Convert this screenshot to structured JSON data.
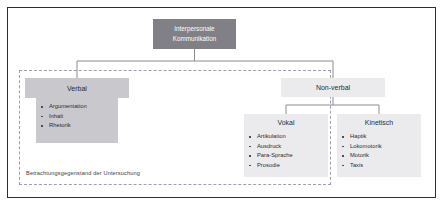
{
  "figure": {
    "root": {
      "label_line1": "Interpersonale",
      "label_line2": "Kommunikation",
      "color": "#808086"
    },
    "branches": [
      {
        "id": "verbal",
        "label": "Verbal",
        "color": "#c9c9cd",
        "items": [
          "Argumentation",
          "Inhalt",
          "Rhetorik"
        ]
      },
      {
        "id": "non-verbal",
        "label": "Non-verbal",
        "color": "#ebebee",
        "children": [
          {
            "id": "vokal",
            "label": "Vokal",
            "color": "#ebebee",
            "items": [
              "Artikulation",
              "Ausdruck",
              "Para-Sprache",
              "Prosodie"
            ]
          },
          {
            "id": "kinetisch",
            "label": "Kinetisch",
            "color": "#ebebee",
            "items": [
              "Haptik",
              "Lokomotorik",
              "Motorik",
              "Taxis"
            ]
          }
        ]
      }
    ],
    "scope": {
      "caption": "Betrachtungsgegenstand der Untersuchung",
      "border_color": "#9aa0b0",
      "style": "dashed"
    },
    "frame_color": "#2d2d33",
    "connector_color": "#8d8d95",
    "background": "#ffffff"
  }
}
